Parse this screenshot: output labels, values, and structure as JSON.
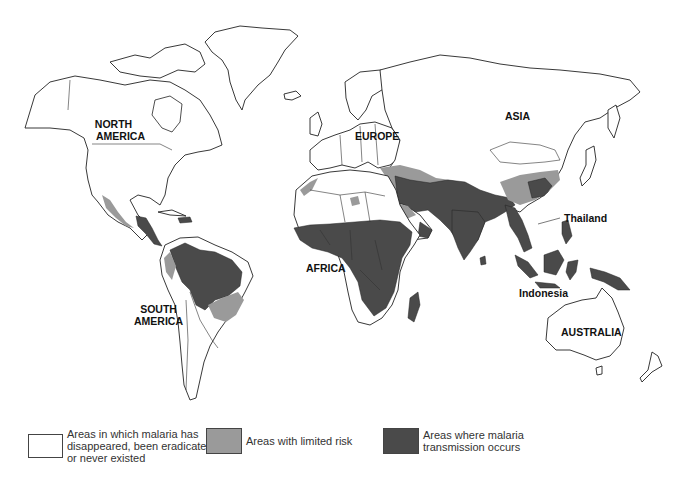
{
  "map": {
    "title": "World distribution of malaria",
    "labels": {
      "north_america": "NORTH\nAMERICA",
      "north_america_l1": "NORTH",
      "north_america_l2": "AMERICA",
      "south_america_l1": "SOUTH",
      "south_america_l2": "AMERICA",
      "europe": "EUROPE",
      "asia": "ASIA",
      "africa": "AFRICA",
      "australia": "AUSTRALIA",
      "thailand": "Thailand",
      "indonesia": "Indonesia"
    },
    "colors": {
      "none": "#ffffff",
      "limited": "#9a9a9a",
      "transmission": "#4a4a4a",
      "outline": "#222222"
    }
  },
  "legend": {
    "items": [
      {
        "label_l1": "Areas in which malaria has",
        "label_l2": "disappeared, been eradicated,",
        "label_l3": "or never existed",
        "color": "#ffffff"
      },
      {
        "label_l1": "Areas with limited risk",
        "color": "#9a9a9a"
      },
      {
        "label_l1": "Areas where malaria",
        "label_l2": "transmission occurs",
        "color": "#4a4a4a"
      }
    ]
  }
}
